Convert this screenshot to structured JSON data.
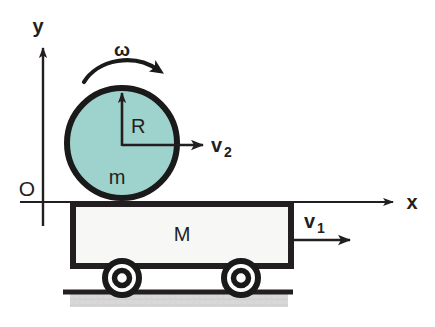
{
  "figure": {
    "background_color": "#ffffff",
    "ink_color": "#231f20",
    "axes": {
      "y_label": "y",
      "x_label": "x",
      "origin_label": "O"
    },
    "cylinder": {
      "mass_label": "m",
      "radius_label": "R",
      "angular_velocity_label": "ω",
      "velocity_label": "v",
      "velocity_subscript": "2",
      "fill_color": "#9ed2cc",
      "stroke_color": "#1a1a1a"
    },
    "cart": {
      "mass_label": "M",
      "velocity_label": "v",
      "velocity_subscript": "1",
      "fill_color": "#f7f7f5",
      "stroke_color": "#231f20",
      "wheel_count": 2
    },
    "ground": {
      "line_color": "#231f20",
      "shadow_color": "#c9c9c9"
    }
  }
}
